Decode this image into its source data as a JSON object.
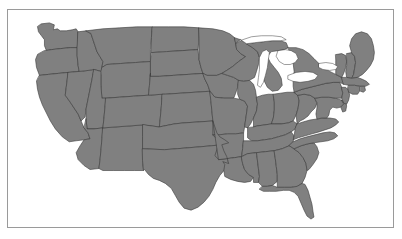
{
  "figure": {
    "kind": "map",
    "title": "",
    "caption": "",
    "frame_visible": true
  },
  "map": {
    "name": "contiguous-united-states",
    "region_label": "Contiguous United States",
    "projection_hint": "albers-usa",
    "background_color": "#ffffff",
    "frame_color": "#9a9a9a",
    "land_fill": "#808080",
    "boundary_color": "#3a3a3a",
    "boundary_width": 0.6,
    "water_fill": "#ffffff",
    "coastline_color": "#3a3a3a",
    "viewbox": "0 0 387 219",
    "state_count": 49,
    "water_bodies": [
      "Lake Superior",
      "Lake Michigan",
      "Lake Huron",
      "Lake Erie",
      "Lake Ontario"
    ],
    "states": [
      {
        "code": "WA",
        "name": "Washington"
      },
      {
        "code": "OR",
        "name": "Oregon"
      },
      {
        "code": "CA",
        "name": "California"
      },
      {
        "code": "NV",
        "name": "Nevada"
      },
      {
        "code": "ID",
        "name": "Idaho"
      },
      {
        "code": "MT",
        "name": "Montana"
      },
      {
        "code": "WY",
        "name": "Wyoming"
      },
      {
        "code": "UT",
        "name": "Utah"
      },
      {
        "code": "AZ",
        "name": "Arizona"
      },
      {
        "code": "NM",
        "name": "New Mexico"
      },
      {
        "code": "CO",
        "name": "Colorado"
      },
      {
        "code": "ND",
        "name": "North Dakota"
      },
      {
        "code": "SD",
        "name": "South Dakota"
      },
      {
        "code": "NE",
        "name": "Nebraska"
      },
      {
        "code": "KS",
        "name": "Kansas"
      },
      {
        "code": "OK",
        "name": "Oklahoma"
      },
      {
        "code": "TX",
        "name": "Texas"
      },
      {
        "code": "MN",
        "name": "Minnesota"
      },
      {
        "code": "IA",
        "name": "Iowa"
      },
      {
        "code": "MO",
        "name": "Missouri"
      },
      {
        "code": "AR",
        "name": "Arkansas"
      },
      {
        "code": "LA",
        "name": "Louisiana"
      },
      {
        "code": "WI",
        "name": "Wisconsin"
      },
      {
        "code": "IL",
        "name": "Illinois"
      },
      {
        "code": "MI",
        "name": "Michigan"
      },
      {
        "code": "IN",
        "name": "Indiana"
      },
      {
        "code": "OH",
        "name": "Ohio"
      },
      {
        "code": "KY",
        "name": "Kentucky"
      },
      {
        "code": "TN",
        "name": "Tennessee"
      },
      {
        "code": "MS",
        "name": "Mississippi"
      },
      {
        "code": "AL",
        "name": "Alabama"
      },
      {
        "code": "GA",
        "name": "Georgia"
      },
      {
        "code": "FL",
        "name": "Florida"
      },
      {
        "code": "SC",
        "name": "South Carolina"
      },
      {
        "code": "NC",
        "name": "North Carolina"
      },
      {
        "code": "VA",
        "name": "Virginia"
      },
      {
        "code": "WV",
        "name": "West Virginia"
      },
      {
        "code": "MD",
        "name": "Maryland"
      },
      {
        "code": "DE",
        "name": "Delaware"
      },
      {
        "code": "PA",
        "name": "Pennsylvania"
      },
      {
        "code": "NJ",
        "name": "New Jersey"
      },
      {
        "code": "NY",
        "name": "New York"
      },
      {
        "code": "CT",
        "name": "Connecticut"
      },
      {
        "code": "RI",
        "name": "Rhode Island"
      },
      {
        "code": "MA",
        "name": "Massachusetts"
      },
      {
        "code": "VT",
        "name": "Vermont"
      },
      {
        "code": "NH",
        "name": "New Hampshire"
      },
      {
        "code": "ME",
        "name": "Maine"
      }
    ]
  }
}
